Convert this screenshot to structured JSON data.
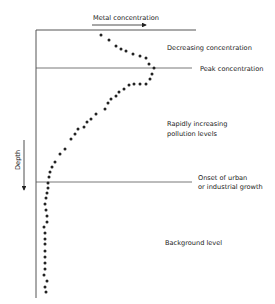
{
  "diagram": {
    "x_axis_label": "Metal concentration",
    "y_axis_label": "Depth",
    "zones": [
      {
        "id": "decreasing",
        "label_lines": [
          "Decreasing concentration"
        ]
      },
      {
        "id": "peak",
        "label_lines": [
          "Peak concentration"
        ]
      },
      {
        "id": "rapid",
        "label_lines": [
          "Rapidly increasing",
          "pollution levels"
        ]
      },
      {
        "id": "onset",
        "label_lines": [
          "Onset of urban",
          "or industrial growth"
        ]
      },
      {
        "id": "background",
        "label_lines": [
          "Background level"
        ]
      }
    ],
    "profile_points": [
      [
        101,
        35
      ],
      [
        109,
        40
      ],
      [
        116,
        46
      ],
      [
        121,
        49
      ],
      [
        126,
        51
      ],
      [
        133,
        54
      ],
      [
        140,
        56
      ],
      [
        146,
        58
      ],
      [
        149,
        64
      ],
      [
        154,
        68
      ],
      [
        152,
        74
      ],
      [
        150,
        79
      ],
      [
        146,
        84
      ],
      [
        140,
        84
      ],
      [
        134,
        84
      ],
      [
        129,
        85
      ],
      [
        124,
        89
      ],
      [
        119,
        92
      ],
      [
        116,
        96
      ],
      [
        111,
        99
      ],
      [
        108,
        103
      ],
      [
        105,
        109
      ],
      [
        96,
        114
      ],
      [
        91,
        119
      ],
      [
        87,
        122
      ],
      [
        84,
        127
      ],
      [
        78,
        129
      ],
      [
        75,
        134
      ],
      [
        71,
        139
      ],
      [
        65,
        149
      ],
      [
        60,
        154
      ],
      [
        55,
        162
      ],
      [
        52,
        167
      ],
      [
        50,
        172
      ],
      [
        49,
        177
      ],
      [
        48,
        183
      ],
      [
        48,
        188
      ],
      [
        47,
        193
      ],
      [
        46,
        198
      ],
      [
        45,
        204
      ],
      [
        46,
        210
      ],
      [
        47,
        216
      ],
      [
        47,
        222
      ],
      [
        44,
        227
      ],
      [
        45,
        233
      ],
      [
        45,
        239
      ],
      [
        45,
        244
      ],
      [
        45,
        251
      ],
      [
        45,
        257
      ],
      [
        45,
        263
      ],
      [
        45,
        269
      ],
      [
        44,
        275
      ],
      [
        47,
        281
      ],
      [
        45,
        287
      ],
      [
        46,
        292
      ]
    ],
    "colors": {
      "ink": "#222222",
      "lines": "#555555"
    }
  }
}
